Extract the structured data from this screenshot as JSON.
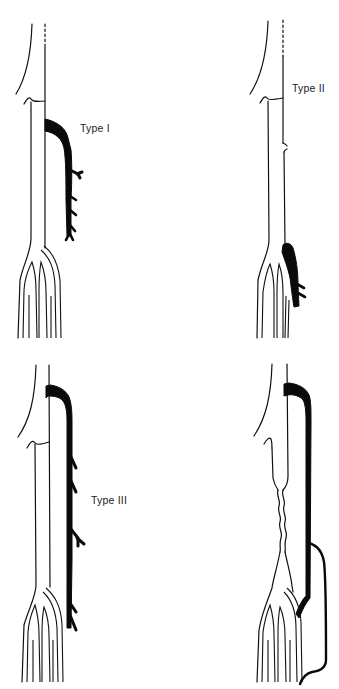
{
  "figure": {
    "panels": [
      {
        "id": "A",
        "label": "Type I",
        "label_pos": [
          80,
          122
        ]
      },
      {
        "id": "B",
        "label": "Type II",
        "label_pos": [
          292,
          82
        ]
      },
      {
        "id": "C",
        "label": "Type III",
        "label_pos": [
          91,
          494
        ]
      },
      {
        "id": "D",
        "label": "",
        "label_pos": null
      }
    ],
    "colors": {
      "background": "#ffffff",
      "line": "#111111",
      "vessel": "#0a0a0a",
      "text": "#222222"
    }
  }
}
